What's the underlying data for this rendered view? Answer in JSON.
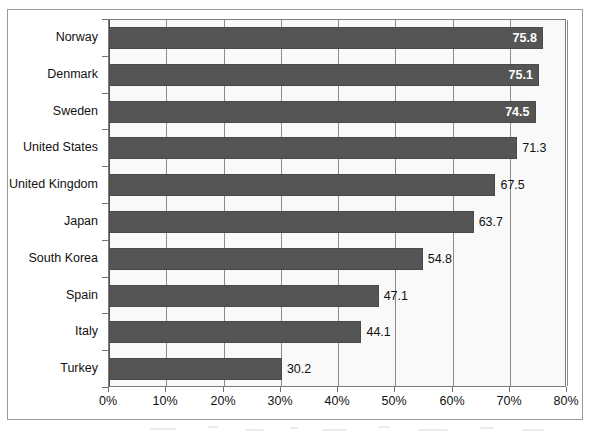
{
  "chart_data": {
    "type": "bar",
    "orientation": "horizontal",
    "title": "",
    "subtitle": "",
    "xlabel": "",
    "ylabel": "",
    "categories": [
      "Norway",
      "Denmark",
      "Sweden",
      "United States",
      "United Kingdom",
      "Japan",
      "South Korea",
      "Spain",
      "Italy",
      "Turkey"
    ],
    "values": [
      75.8,
      75.1,
      74.5,
      71.3,
      67.5,
      63.7,
      54.8,
      47.1,
      44.1,
      30.2
    ],
    "value_labels": [
      "75.8",
      "75.1",
      "74.5",
      "71.3",
      "67.5",
      "63.7",
      "54.8",
      "47.1",
      "44.1",
      "30.2"
    ],
    "label_placement": [
      "inside",
      "inside",
      "inside",
      "outside",
      "outside",
      "outside",
      "outside",
      "outside",
      "outside",
      "outside"
    ],
    "xlim": [
      0,
      80
    ],
    "xticks": [
      0,
      10,
      20,
      30,
      40,
      50,
      60,
      70,
      80
    ],
    "xtick_labels": [
      "0%",
      "10%",
      "20%",
      "30%",
      "40%",
      "50%",
      "60%",
      "70%",
      "80%"
    ],
    "grid": true,
    "grid_axis": "x",
    "legend": false,
    "legend_position": "none",
    "colors": {
      "bar_fill": "#555555",
      "bar_border": "#4a4a4a",
      "plot_background": "#f9f9f9",
      "gridline": "#8c8c8c",
      "axis": "#7d7d7d",
      "frame_border": "#9a9a9a",
      "label_inside": "#ffffff",
      "label_outside": "#111111",
      "text": "#111111",
      "page_background": "#ffffff"
    }
  }
}
